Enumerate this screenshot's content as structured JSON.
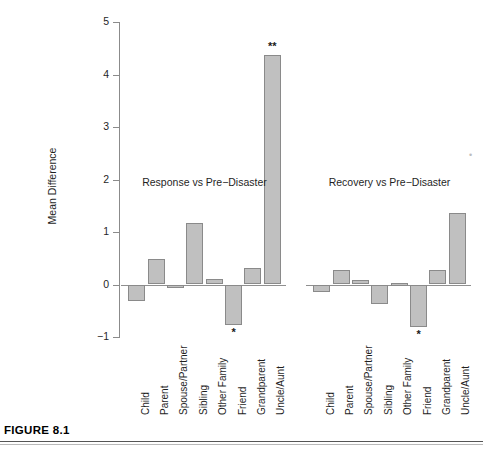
{
  "figure": {
    "caption_label": "FIGURE 8.1"
  },
  "axis": {
    "y_title": "Mean Difference",
    "y_ticks": [
      "5",
      "4",
      "3",
      "2",
      "1",
      "0",
      "-1"
    ],
    "y_tick_values": [
      5,
      4,
      3,
      2,
      1,
      0,
      -1
    ]
  },
  "groups": [
    {
      "label": "Response vs Pre-Disaster"
    },
    {
      "label": "Recovery vs Pre-Disaster"
    }
  ],
  "categories": [
    "Child",
    "Parent",
    "Spouse/Partner",
    "Sibling",
    "Other Family",
    "Friend",
    "Grandparent",
    "Uncle/Aunt"
  ],
  "markers": {
    "single": "*",
    "double": "**"
  },
  "chart_data": {
    "type": "bar",
    "title": "",
    "subtitle": "",
    "xlabel": "",
    "ylabel": "Mean Difference",
    "ylim": [
      -1,
      5
    ],
    "grid": false,
    "legend_position": "none",
    "bar_fill_color": "#c0c0c0",
    "bar_edge_color": "#8a8a8a",
    "categories": [
      "Child",
      "Parent",
      "Spouse/Partner",
      "Sibling",
      "Other Family",
      "Friend",
      "Grandparent",
      "Uncle/Aunt"
    ],
    "series": [
      {
        "name": "Response vs Pre-Disaster",
        "values": [
          -0.32,
          0.49,
          -0.05,
          1.18,
          0.11,
          -0.77,
          0.32,
          4.38
        ],
        "significance": [
          "",
          "",
          "",
          "",
          "",
          "*",
          "",
          "**"
        ]
      },
      {
        "name": "Recovery vs Pre-Disaster",
        "values": [
          -0.15,
          0.27,
          0.08,
          -0.38,
          0.03,
          -0.8,
          0.27,
          1.37
        ],
        "significance": [
          "",
          "",
          "",
          "",
          "",
          "*",
          "",
          ""
        ]
      }
    ],
    "annotations": [
      {
        "text": "Response vs Pre-Disaster",
        "x_category": "Sibling",
        "y": 1.95
      },
      {
        "text": "Recovery vs Pre-Disaster",
        "x_category": "Sibling",
        "y": 1.95
      },
      {
        "text": "**",
        "series": "Response vs Pre-Disaster",
        "x_category": "Uncle/Aunt",
        "y": 4.6
      },
      {
        "text": "*",
        "series": "Response vs Pre-Disaster",
        "x_category": "Friend",
        "y": -0.95
      },
      {
        "text": "*",
        "series": "Recovery vs Pre-Disaster",
        "x_category": "Friend",
        "y": -0.95
      }
    ]
  }
}
